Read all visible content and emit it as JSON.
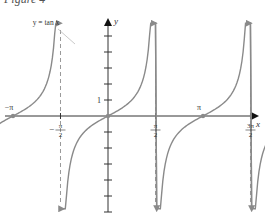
{
  "figure": {
    "title": "Figure 4"
  },
  "chart_data": {
    "type": "line",
    "title": "Figure 4",
    "function_label": "y = tan x",
    "xlabel": "x",
    "ylabel": "y",
    "x_ticks": [
      {
        "value": -4.712,
        "label_num": "3π",
        "label_den": "2",
        "sign": "−",
        "fraction": true
      },
      {
        "value": -1.571,
        "label_num": "π",
        "label_den": "2",
        "sign": "−",
        "fraction": true
      },
      {
        "value": 1.571,
        "label_num": "π",
        "label_den": "2",
        "sign": "",
        "fraction": true
      },
      {
        "value": 4.712,
        "label_num": "3π",
        "label_den": "2",
        "sign": "",
        "fraction": true
      },
      {
        "value": 7.854,
        "label_num": "5π",
        "label_den": "2",
        "sign": "",
        "fraction": true
      }
    ],
    "zero_labels": [
      {
        "value": -3.1416,
        "label": "−π"
      },
      {
        "value": 3.1416,
        "label": "π"
      },
      {
        "value": 6.2832,
        "label": "2π"
      }
    ],
    "y_ticks": [
      -6,
      -5,
      -4,
      -3,
      -2,
      -1,
      1,
      2,
      3,
      4,
      5
    ],
    "y_tick_labels": [
      {
        "value": 1,
        "label": "1"
      }
    ],
    "asymptotes": [
      -4.712,
      -1.571,
      1.571,
      4.712,
      7.854
    ],
    "zeros": [
      -3.1416,
      0,
      3.1416,
      6.2832
    ],
    "branches": [
      {
        "x_start": -5.8,
        "x_end": -4.75
      },
      {
        "x_start": -4.67,
        "x_end": -1.61
      },
      {
        "x_start": -1.53,
        "x_end": 1.61
      },
      {
        "x_start": 1.53,
        "x_end": 4.75
      },
      {
        "x_start": 4.67,
        "x_end": 7.89
      },
      {
        "x_start": 7.81,
        "x_end": 8.7
      }
    ],
    "xlim": [
      -6.9,
      10.0
    ],
    "ylim": [
      -6,
      6
    ],
    "grid": false,
    "colors": {
      "curve": "#8a8a8a",
      "axis": "#333333",
      "asymptote": "#999999",
      "point": "#8a8a8a"
    }
  }
}
